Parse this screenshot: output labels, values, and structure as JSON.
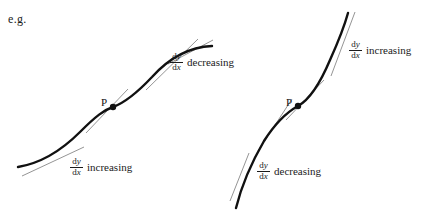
{
  "page": {
    "width": 422,
    "height": 212,
    "background": "#ffffff",
    "ink_color": "#111111",
    "tangent_color": "#5a5a5a"
  },
  "caption": {
    "eg_label": "e.g."
  },
  "diagrams": [
    {
      "id": "left-diagram",
      "name": "increasing-then-decreasing-gradient",
      "point_label": "P",
      "curve_shape": "sigmoid",
      "annotations": [
        {
          "id": "left-upper-annotation",
          "numerator": "dy",
          "denominator": "dx",
          "word": "decreasing",
          "x": 170,
          "y": 53
        },
        {
          "id": "left-lower-annotation",
          "numerator": "dy",
          "denominator": "dx",
          "word": "increasing",
          "x": 70,
          "y": 158
        }
      ]
    },
    {
      "id": "right-diagram",
      "name": "decreasing-then-increasing-gradient",
      "point_label": "P",
      "curve_shape": "inverted-sigmoid",
      "annotations": [
        {
          "id": "right-upper-annotation",
          "numerator": "dy",
          "denominator": "dx",
          "word": "increasing",
          "x": 349,
          "y": 41
        },
        {
          "id": "right-lower-annotation",
          "numerator": "dy",
          "denominator": "dx",
          "word": "decreasing",
          "x": 257,
          "y": 162
        }
      ]
    }
  ],
  "chart_data": {
    "type": "line",
    "title": "",
    "xlabel": "",
    "ylabel": "",
    "grid": false,
    "legend": false,
    "series": [
      {
        "name": "left-curve",
        "description": "S-shaped curve, concave up below P then concave down above P; inflection point at P",
        "points": [
          [
            18,
            166
          ],
          [
            30,
            162
          ],
          [
            45,
            155
          ],
          [
            60,
            143
          ],
          [
            75,
            130
          ],
          [
            90,
            118
          ],
          [
            104,
            110
          ],
          [
            113,
            107
          ],
          [
            124,
            101
          ],
          [
            140,
            89
          ],
          [
            155,
            74
          ],
          [
            170,
            60
          ],
          [
            185,
            51
          ],
          [
            200,
            47
          ],
          [
            212,
            46
          ]
        ],
        "inflection_point": [
          113,
          107
        ]
      },
      {
        "name": "right-curve",
        "description": "Steep S-shaped curve, concave down below P then concave up above P; inflection point at P",
        "points": [
          [
            236,
            207
          ],
          [
            240,
            192
          ],
          [
            246,
            176
          ],
          [
            253,
            160
          ],
          [
            262,
            143
          ],
          [
            272,
            128
          ],
          [
            284,
            116
          ],
          [
            295,
            108
          ],
          [
            303,
            100
          ],
          [
            312,
            88
          ],
          [
            322,
            72
          ],
          [
            331,
            55
          ],
          [
            339,
            38
          ],
          [
            345,
            24
          ],
          [
            348,
            13
          ]
        ],
        "inflection_point": [
          298,
          106
        ]
      }
    ],
    "tangents": [
      {
        "name": "left-lower-tangent",
        "from": [
          22,
          175
        ],
        "to": [
          80,
          148
        ]
      },
      {
        "name": "left-mid-tangent",
        "from": [
          88,
          131
        ],
        "to": [
          126,
          91
        ]
      },
      {
        "name": "left-upper-tangent",
        "from": [
          148,
          88
        ],
        "to": [
          196,
          40
        ]
      },
      {
        "name": "left-top-tangent",
        "from": [
          170,
          63
        ],
        "to": [
          212,
          41
        ]
      },
      {
        "name": "right-lower-tangent",
        "from": [
          231,
          199
        ],
        "to": [
          247,
          156
        ]
      },
      {
        "name": "right-mid-tangent",
        "from": [
          260,
          148
        ],
        "to": [
          290,
          101
        ]
      },
      {
        "name": "right-upper-tangent",
        "from": [
          287,
          118
        ],
        "to": [
          322,
          82
        ]
      },
      {
        "name": "right-top-tangent",
        "from": [
          332,
          72
        ],
        "to": [
          354,
          13
        ]
      }
    ]
  }
}
